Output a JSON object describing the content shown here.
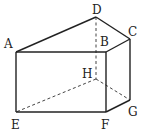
{
  "diagram": {
    "type": "prism",
    "vertices": {
      "A": {
        "label": "A",
        "x": 16,
        "y": 52,
        "lx": 4,
        "ly": 48
      },
      "B": {
        "label": "B",
        "x": 106,
        "y": 52,
        "lx": 100,
        "ly": 46
      },
      "C": {
        "label": "C",
        "x": 130,
        "y": 39,
        "lx": 128,
        "ly": 36
      },
      "D": {
        "label": "D",
        "x": 96,
        "y": 17,
        "lx": 92,
        "ly": 14
      },
      "E": {
        "label": "E",
        "x": 16,
        "y": 112,
        "lx": 11,
        "ly": 129
      },
      "F": {
        "label": "F",
        "x": 106,
        "y": 112,
        "lx": 101,
        "ly": 129
      },
      "G": {
        "label": "G",
        "x": 130,
        "y": 100,
        "lx": 128,
        "ly": 116
      },
      "H": {
        "label": "H",
        "x": 96,
        "y": 79,
        "lx": 82,
        "ly": 78
      }
    },
    "visible_edges": [
      [
        "A",
        "B"
      ],
      [
        "A",
        "D"
      ],
      [
        "D",
        "C"
      ],
      [
        "B",
        "C"
      ],
      [
        "A",
        "E"
      ],
      [
        "B",
        "F"
      ],
      [
        "C",
        "G"
      ],
      [
        "E",
        "F"
      ],
      [
        "F",
        "G"
      ]
    ],
    "hidden_edges": [
      [
        "D",
        "H"
      ],
      [
        "H",
        "E"
      ],
      [
        "H",
        "G"
      ]
    ]
  }
}
